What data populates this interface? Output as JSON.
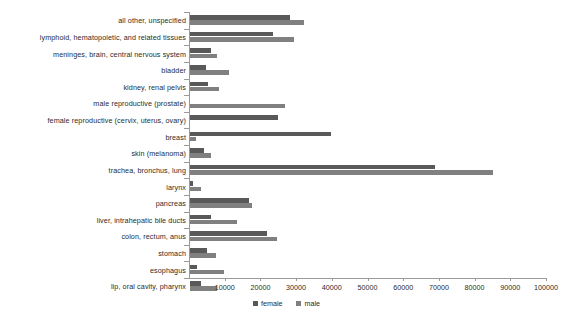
{
  "chart_data": {
    "type": "bar",
    "orientation": "horizontal",
    "title": "",
    "xlabel": "",
    "ylabel": "",
    "xlim": [
      0,
      100000
    ],
    "xticks": [
      10000,
      20000,
      30000,
      40000,
      50000,
      60000,
      70000,
      80000,
      90000,
      100000
    ],
    "xtick_labels": [
      "10000",
      "20000",
      "30000",
      "40000",
      "50000",
      "60000",
      "70000",
      "80000",
      "90000",
      "100000"
    ],
    "grid": false,
    "legend_position": "bottom-center",
    "categories": [
      "all other, unspecified",
      "lymphoid, hematopoietic, and related tissues",
      "meninges, brain, central nervous system",
      "bladder",
      "kidney, renal pelvis",
      "male reproductive (prostate)",
      "female reproductive (cervix, uterus, ovary)",
      "breast",
      "skin (melanoma)",
      "trachea, bronchus, lung",
      "larynx",
      "pancreas",
      "liver, intrahepatic bile ducts",
      "colon, rectum, anus",
      "stomach",
      "esophagus",
      "lip, oral cavity, pharynx"
    ],
    "series": [
      {
        "name": "female",
        "color": "#595959",
        "values": [
          28000,
          23200,
          5900,
          4400,
          5000,
          0,
          24600,
          39500,
          4000,
          68500,
          800,
          16500,
          5800,
          21600,
          4900,
          2100,
          3200
        ]
      },
      {
        "name": "male",
        "color": "#808080",
        "values": [
          31800,
          29100,
          7500,
          11000,
          8000,
          26500,
          0,
          1800,
          5900,
          85000,
          3100,
          17400,
          13100,
          24400,
          7400,
          9400,
          7600
        ]
      }
    ],
    "legend": [
      {
        "label": "female",
        "color": "#595959"
      },
      {
        "label": "male",
        "color": "#808080"
      }
    ]
  }
}
